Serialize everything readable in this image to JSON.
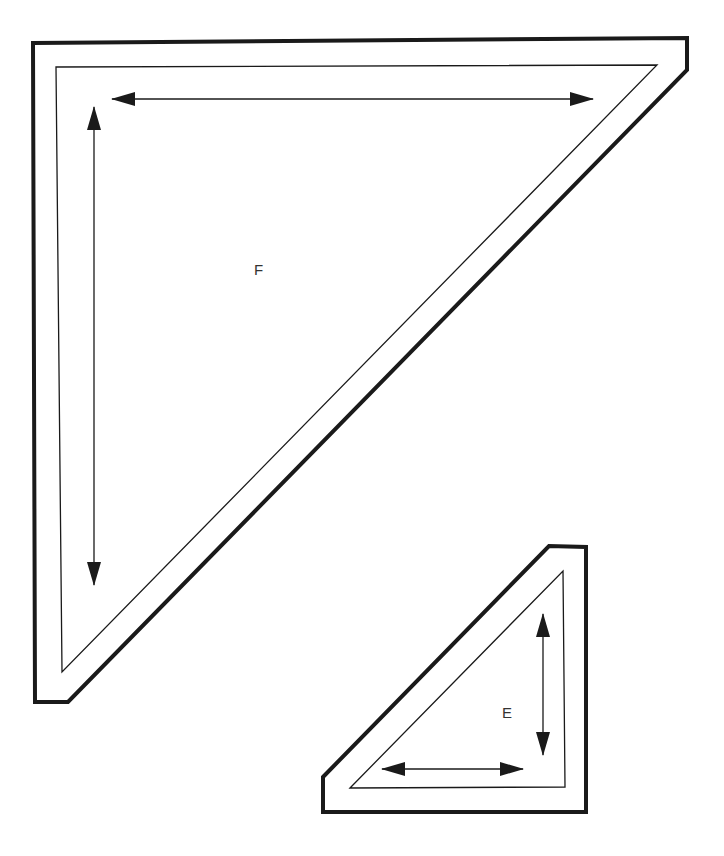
{
  "diagram": {
    "type": "pattern-template",
    "stroke_color": "#1a1a1a",
    "pieces": [
      {
        "id": "F",
        "label": "F",
        "label_pos": [
          254,
          275
        ],
        "outer": [
          [
            33,
            43
          ],
          [
            687,
            38
          ],
          [
            687,
            70
          ],
          [
            68,
            702
          ],
          [
            35,
            702
          ]
        ],
        "inner": [
          [
            56,
            67
          ],
          [
            657,
            65
          ],
          [
            62,
            672
          ]
        ],
        "grain_arrows": [
          {
            "orientation": "horizontal",
            "from": [
              112,
              99
            ],
            "to": [
              593,
              99
            ]
          },
          {
            "orientation": "vertical",
            "from": [
              94,
              107
            ],
            "to": [
              94,
              585
            ]
          }
        ]
      },
      {
        "id": "E",
        "label": "E",
        "label_pos": [
          502,
          718
        ],
        "outer": [
          [
            323,
            777
          ],
          [
            549,
            546
          ],
          [
            586,
            547
          ],
          [
            586,
            812
          ],
          [
            323,
            812
          ]
        ],
        "inner": [
          [
            350,
            788
          ],
          [
            563,
            571
          ],
          [
            565,
            787
          ]
        ],
        "grain_arrows": [
          {
            "orientation": "vertical",
            "from": [
              543,
              614
            ],
            "to": [
              543,
              755
            ]
          },
          {
            "orientation": "horizontal",
            "from": [
              382,
              769
            ],
            "to": [
              523,
              769
            ]
          }
        ]
      }
    ]
  }
}
